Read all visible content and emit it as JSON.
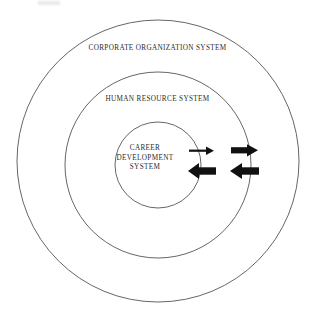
{
  "diagram": {
    "type": "concentric-circles",
    "background_color": "#ffffff",
    "stroke_color": "#555555",
    "text_color": "#2b2b2b",
    "arrow_color": "#111111",
    "rings": [
      {
        "id": "outer",
        "label": "CORPORATE ORGANIZATION SYSTEM",
        "center_x": 158,
        "center_y": 161,
        "radius": 141
      },
      {
        "id": "middle",
        "label": "HUMAN RESOURCE SYSTEM",
        "center_x": 158,
        "center_y": 165,
        "radius": 93
      },
      {
        "id": "inner",
        "label_lines": [
          "CAREER",
          "DEVELOPMENT",
          "SYSTEM"
        ],
        "label": "CAREER DEVELOPMENT SYSTEM",
        "center_x": 158,
        "center_y": 165,
        "radius": 43
      }
    ],
    "arrow_pairs": [
      {
        "id": "inner-boundary-exchange",
        "crosses_ring": "inner",
        "outbound": {
          "direction": "right",
          "weight": "thin",
          "x1": 189,
          "x2": 214,
          "y": 151
        },
        "inbound": {
          "direction": "left",
          "weight": "thick",
          "x1": 188,
          "x2": 216,
          "y": 171
        }
      },
      {
        "id": "middle-boundary-exchange",
        "crosses_ring": "middle",
        "outbound": {
          "direction": "right",
          "weight": "thick",
          "x1": 231,
          "x2": 258,
          "y": 150
        },
        "inbound": {
          "direction": "left",
          "weight": "thick",
          "x1": 230,
          "x2": 259,
          "y": 171
        }
      }
    ]
  }
}
